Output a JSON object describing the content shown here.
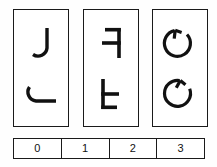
{
  "task": {
    "type": "mental-rotation-panel-puzzle",
    "background_color": "#fefefe",
    "stroke_color": "#1a1a1a",
    "panel_count": 3,
    "glyph_rows_per_panel": 2
  },
  "panels": [
    {
      "index": 0,
      "name": "panel-j",
      "top": {
        "glyph": "J",
        "icon_name": "letter-j-glyph",
        "rotation_deg": 0,
        "mirrored": false
      },
      "bottom": {
        "glyph": "J",
        "icon_name": "letter-j-rotated-glyph",
        "rotation_deg": 90,
        "mirrored": false
      }
    },
    {
      "index": 1,
      "name": "panel-f",
      "top": {
        "glyph": "F",
        "icon_name": "letter-f-mirrored-glyph",
        "rotation_deg": 0,
        "mirrored": true
      },
      "bottom": {
        "glyph": "F",
        "icon_name": "letter-f-rotated-glyph",
        "rotation_deg": 180,
        "mirrored": true
      }
    },
    {
      "index": 2,
      "name": "panel-circle-arrow",
      "top": {
        "glyph": "G",
        "icon_name": "circle-arrow-glyph",
        "rotation_deg": 0,
        "mirrored": false
      },
      "bottom": {
        "glyph": "G",
        "icon_name": "circle-arrow-rotated-glyph",
        "rotation_deg": 25,
        "mirrored": false
      }
    }
  ],
  "answer_strip": {
    "name": "answer-options",
    "options": [
      {
        "label": "0",
        "value": 0
      },
      {
        "label": "1",
        "value": 1
      },
      {
        "label": "2",
        "value": 2
      },
      {
        "label": "3",
        "value": 3
      }
    ]
  }
}
